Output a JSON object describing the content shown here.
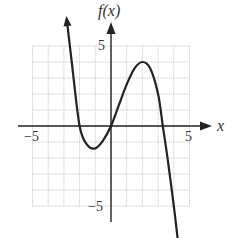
{
  "chart_data": {
    "type": "line",
    "title": "",
    "xlabel": "x",
    "ylabel": "f(x)",
    "xlim": [
      -5,
      5
    ],
    "ylim": [
      -5,
      5
    ],
    "grid": true,
    "tick_labels": {
      "x": [
        "-5",
        "5"
      ],
      "y": [
        "5",
        "-5"
      ]
    },
    "series": [
      {
        "name": "f(x)",
        "description": "cubic-like curve with negative leading coefficient, arrows at both ends",
        "x": [
          -2.8,
          -2.5,
          -2,
          -1.5,
          -1,
          -0.5,
          0,
          0.5,
          1,
          1.5,
          2,
          2.5,
          3,
          3.3,
          3.6,
          4,
          4.3
        ],
        "y": [
          6.5,
          4.0,
          0.0,
          -1.2,
          -1.4,
          -0.9,
          0.0,
          1.3,
          2.6,
          3.6,
          4.0,
          3.6,
          2.0,
          0.0,
          -2.0,
          -5.0,
          -7.5
        ]
      }
    ],
    "key_points": {
      "x_intercepts": [
        -2,
        0,
        3.3
      ],
      "local_min": [
        -1,
        -1.4
      ],
      "local_max": [
        2,
        4
      ]
    }
  },
  "labels": {
    "y_axis": "f(x)",
    "x_axis": "x",
    "x_neg": "−5",
    "x_pos": "5",
    "y_pos": "5",
    "y_neg": "−5"
  }
}
